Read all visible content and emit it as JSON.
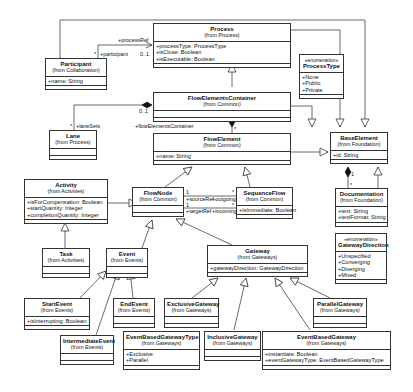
{
  "diagram": {
    "type": "UML class diagram",
    "classes": {
      "process": {
        "name": "Process",
        "package": "(from Process)",
        "attributes": [
          "+processType: ProcessType",
          "+isClose: Boolean",
          "+isExecutable: Boolean"
        ]
      },
      "participant": {
        "name": "Participant",
        "package": "(from Collaboration)",
        "attributes": [
          "+name: String"
        ]
      },
      "process_type": {
        "stereotype": "«enumeration»",
        "name": "ProcessType",
        "attributes": [
          "+None",
          "+Public",
          "+Private"
        ]
      },
      "flow_elements_container": {
        "name": "FlowElementsContainer",
        "package": "(from Common)",
        "attributes": []
      },
      "lane": {
        "name": "Lane",
        "package": "(from Process)",
        "attributes": []
      },
      "flow_element": {
        "name": "FlowElement",
        "package": "(from Common)",
        "attributes": [
          "+name: String"
        ]
      },
      "base_element": {
        "name": "BaseElement",
        "package": "(from Foundation)",
        "attributes": [
          "+id: String"
        ]
      },
      "documentation": {
        "name": "Documentation",
        "package": "(from Foundation)",
        "attributes": [
          "+text: String",
          "+textFormat: String"
        ]
      },
      "activity": {
        "name": "Activity",
        "package": "(from Activities)",
        "attributes": [
          "+isForCompensation: Boolean",
          "+startQuantity: Integer",
          "+completionQuantity: Integer"
        ]
      },
      "flow_node": {
        "name": "FlowNode",
        "package": "(from Common)",
        "attributes": []
      },
      "sequence_flow": {
        "name": "SequenceFlow",
        "package": "(from Common)",
        "attributes": [
          "+isImmediate: Boolean"
        ]
      },
      "task": {
        "name": "Task",
        "package": "(from Activities)",
        "attributes": []
      },
      "event": {
        "name": "Event",
        "package": "(from Events)",
        "attributes": []
      },
      "gateway": {
        "name": "Gateway",
        "package": "(from Gateways)",
        "attributes": [
          "+gatewayDirection: GatewayDirection"
        ]
      },
      "gateway_direction": {
        "stereotype": "«enumeration»",
        "name": "GatewayDirection",
        "attributes": [
          "+Unspecified",
          "+Converging",
          "+Diverging",
          "+Mixed"
        ]
      },
      "start_event": {
        "name": "StartEvent",
        "package": "(from Events)",
        "attributes": [
          "+isInterrupting: Boolean"
        ]
      },
      "end_event": {
        "name": "EndEvent",
        "package": "(from Events)",
        "attributes": []
      },
      "intermediate_event": {
        "name": "IntermediateEvent",
        "package": "(from Events)",
        "attributes": []
      },
      "exclusive_gateway": {
        "name": "ExclusiveGateway",
        "package": "(from Gateways)",
        "attributes": []
      },
      "inclusive_gateway": {
        "name": "InclusiveGateway",
        "package": "(from Gateways)",
        "attributes": []
      },
      "parallel_gateway": {
        "name": "ParallelGateway",
        "package": "(from Gateways)",
        "attributes": []
      },
      "event_based_gateway_type": {
        "name": "EventBasedGatewayType",
        "package": "(from Gateways)",
        "attributes": [
          "+Exclusive",
          "+Parallel"
        ]
      },
      "event_based_gateway": {
        "name": "EventBasedGateway",
        "package": "(from Gateways)",
        "attributes": [
          "+instantiate: Boolean",
          "+eventGatewayType: EventBasedGatewayType"
        ]
      }
    },
    "labels": {
      "process_ref": "+processRef",
      "participant_role": "+participant",
      "star1": "*",
      "mult_01_a": "0..1",
      "lane_sets": "+laneSets",
      "star2": "*",
      "mult_01_b": "0..1",
      "flow_elements_container_role": "+flowElementsContainer",
      "star3": "*",
      "source_ref": "+sourceRef",
      "target_ref": "+targetRef",
      "outgoing": "+outgoing",
      "incoming": "+incoming",
      "one_a": "1",
      "one_b": "1",
      "star4": "*",
      "star5": "*",
      "doc_one": "1",
      "doc_star": "*"
    }
  }
}
